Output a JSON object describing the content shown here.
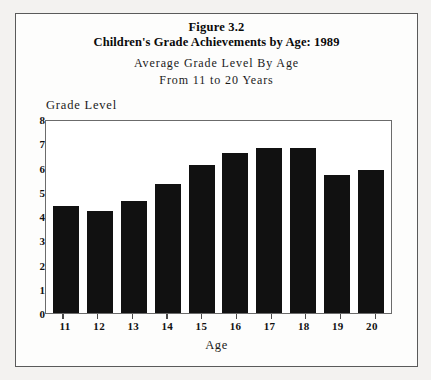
{
  "figure": {
    "number_label": "Figure 3.2",
    "title": "Children's Grade Achievements by Age: 1989",
    "subtitle_line1": "Average Grade Level By Age",
    "subtitle_line2": "From 11 to 20 Years"
  },
  "chart_data": {
    "type": "bar",
    "title": "Children's Grade Achievements by Age: 1989",
    "subtitle": "Average Grade Level By Age From 11 to 20 Years",
    "categories": [
      "11",
      "12",
      "13",
      "14",
      "15",
      "16",
      "17",
      "18",
      "19",
      "20"
    ],
    "values": [
      4.4,
      4.2,
      4.6,
      5.3,
      6.1,
      6.6,
      6.8,
      6.8,
      5.7,
      5.9
    ],
    "xlabel": "Age",
    "ylabel": "Grade Level",
    "ylim": [
      0,
      8
    ],
    "yticks": [
      0,
      1,
      2,
      3,
      4,
      5,
      6,
      7,
      8
    ],
    "ytick_labels": [
      "0",
      "1",
      "2",
      "3",
      "4",
      "5",
      "6",
      "7",
      "8"
    ],
    "grid": false,
    "legend": false,
    "bar_color": "#111111",
    "plot_background": "#ffffff",
    "frame_color": "#6b6b6b"
  }
}
